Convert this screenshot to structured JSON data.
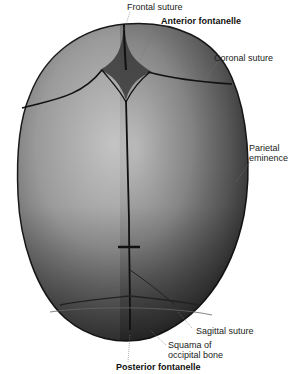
{
  "figure": {
    "labels": {
      "frontal_suture": "Frontal suture",
      "anterior_fontanelle": "Anterior fontanelle",
      "coronal_suture": "Coronal suture",
      "parietal_eminence_line1": "Parietal",
      "parietal_eminence_line2": "eminence",
      "sagittal_suture": "Sagittal suture",
      "squama_line1": "Squama of",
      "squama_line2": "occipital bone",
      "posterior_fontanelle": "Posterior fontanelle"
    },
    "colors": {
      "background": "#ffffff",
      "bone_light": "#b8b8b8",
      "bone_dark": "#2a2a2a",
      "suture": "#111111",
      "label_text": "#222222"
    }
  }
}
